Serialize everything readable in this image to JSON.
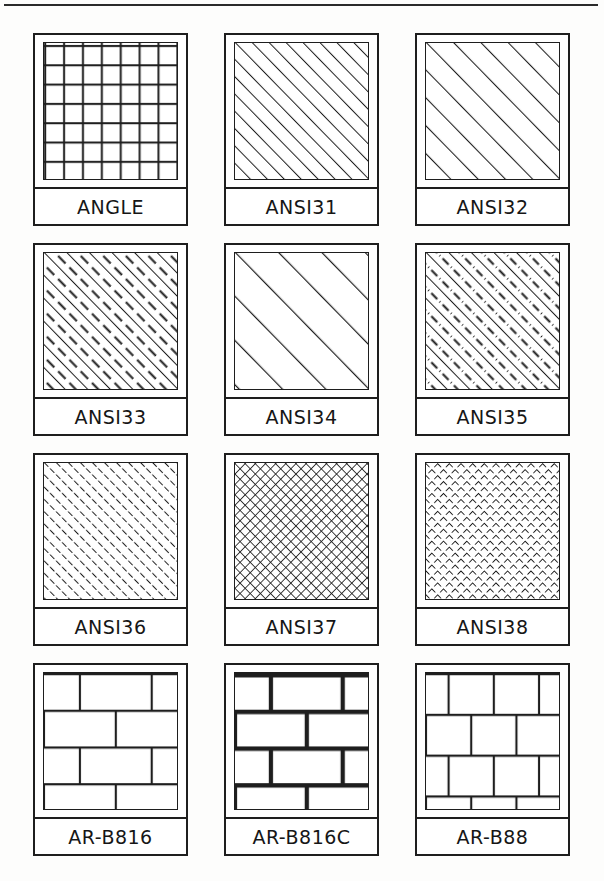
{
  "sheet": {
    "title": "AutoCAD Hatch Pattern Reference Sheet",
    "ink_color": "#1e1e1e",
    "paper_color": "#fdfdfc",
    "columns": 3,
    "rows": 4,
    "has_top_rule": true
  },
  "patterns": [
    {
      "name": "ANGLE",
      "kind": "angle-steel-grid",
      "row": 0,
      "col": 0
    },
    {
      "name": "ANSI31",
      "kind": "diagonal-solid",
      "row": 0,
      "col": 1
    },
    {
      "name": "ANSI32",
      "kind": "diagonal-wide",
      "row": 0,
      "col": 2
    },
    {
      "name": "ANSI33",
      "kind": "diagonal-alt-dash",
      "row": 1,
      "col": 0
    },
    {
      "name": "ANSI34",
      "kind": "diagonal-verywide",
      "row": 1,
      "col": 1
    },
    {
      "name": "ANSI35",
      "kind": "diagonal-dashdot",
      "row": 1,
      "col": 2
    },
    {
      "name": "ANSI36",
      "kind": "diagonal-alldashdot",
      "row": 2,
      "col": 0
    },
    {
      "name": "ANSI37",
      "kind": "crosshatch-solid",
      "row": 2,
      "col": 1
    },
    {
      "name": "ANSI38",
      "kind": "crosshatch-dashed",
      "row": 2,
      "col": 2
    },
    {
      "name": "AR-B816",
      "kind": "brick-816",
      "row": 3,
      "col": 0
    },
    {
      "name": "AR-B816C",
      "kind": "brick-816c",
      "row": 3,
      "col": 1
    },
    {
      "name": "AR-B88",
      "kind": "brick-88",
      "row": 3,
      "col": 2
    }
  ]
}
